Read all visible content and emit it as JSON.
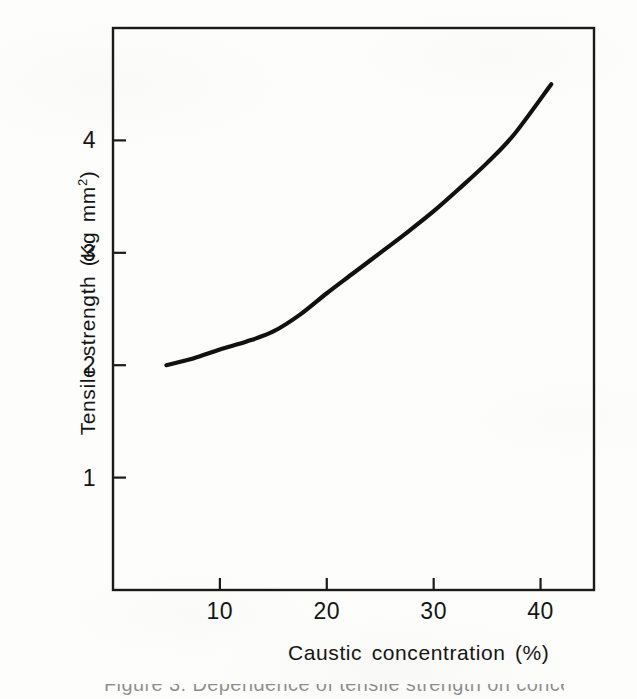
{
  "figure": {
    "background_color": "#fdfdfb",
    "ink_color": "#111111",
    "caption_partial": "Figure  3.  Dependence of  tensile  strength  on  concentration"
  },
  "chart_data": {
    "type": "line",
    "title": "",
    "xlabel": "Caustic concentration (%)",
    "ylabel": "Tensile strength (Kg mm²)",
    "ylabel_parts": {
      "text": "Tensile strength  (Kg  mm",
      "superscript": "2",
      "close": ")"
    },
    "xlim": [
      0,
      45
    ],
    "ylim": [
      0,
      5
    ],
    "xticks": [
      10,
      20,
      30,
      40
    ],
    "xtick_labels": [
      "10",
      "20",
      "30",
      "40"
    ],
    "yticks": [
      1,
      2,
      3,
      4
    ],
    "ytick_labels": [
      "1",
      "2",
      "3",
      "4"
    ],
    "grid": false,
    "legend": "none",
    "frame": "box",
    "series": [
      {
        "name": "Tensile strength vs caustic concentration",
        "color": "#111111",
        "line_width": 4.2,
        "x": [
          5,
          7.5,
          10,
          12.5,
          15,
          17.5,
          20,
          22.5,
          25,
          27.5,
          30,
          32.5,
          35,
          37.5,
          41
        ],
        "y": [
          2.0,
          2.06,
          2.14,
          2.21,
          2.3,
          2.45,
          2.64,
          2.82,
          3.0,
          3.18,
          3.37,
          3.58,
          3.8,
          4.05,
          4.5
        ]
      }
    ]
  }
}
